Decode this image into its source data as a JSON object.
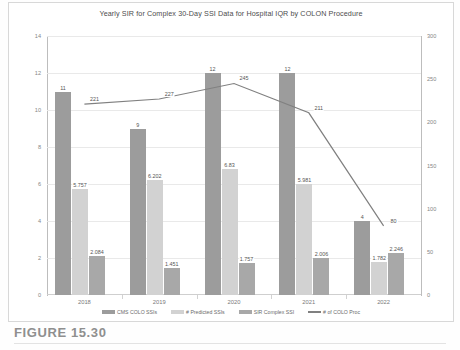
{
  "figure": {
    "caption": "FIGURE 15.30"
  },
  "chart_data": {
    "type": "bar",
    "title": "Yearly SIR for Complex 30-Day SSI Data for Hospital IQR by COLON Procedure",
    "xlabel": "",
    "ylabel": "",
    "categories": [
      "2018",
      "2019",
      "2020",
      "2021",
      "2022"
    ],
    "ylim": [
      0,
      14
    ],
    "yticks": [
      "0",
      "2",
      "4",
      "6",
      "8",
      "10",
      "12",
      "14"
    ],
    "y2lim": [
      0,
      300
    ],
    "y2ticks": [
      "0",
      "50",
      "100",
      "150",
      "200",
      "250",
      "300"
    ],
    "grid": true,
    "legend_position": "bottom",
    "series": [
      {
        "name": "CMS COLO SSIs",
        "type": "bar",
        "axis": "left",
        "color": "#9c9c9c",
        "values": [
          11,
          9,
          12,
          12,
          4
        ],
        "labels": [
          "11",
          "9",
          "12",
          "12",
          "4"
        ]
      },
      {
        "name": "# Predicted SSIs",
        "type": "bar",
        "axis": "left",
        "color": "#d2d2d2",
        "values": [
          5.757,
          6.202,
          6.83,
          5.981,
          1.782
        ],
        "labels": [
          "5.757",
          "6.202",
          "6.83",
          "5.981",
          "1.782"
        ]
      },
      {
        "name": "SIR Complex SSI",
        "type": "bar",
        "axis": "left",
        "color": "#a8a8a8",
        "values": [
          2.084,
          1.451,
          1.757,
          2.006,
          2.246
        ],
        "labels": [
          "2.084",
          "1.451",
          "1.757",
          "2.006",
          "2.246"
        ]
      },
      {
        "name": "# of COLO Proc",
        "type": "line",
        "axis": "right",
        "color": "#808080",
        "values": [
          221,
          227,
          245,
          211,
          80
        ],
        "labels": [
          "221",
          "227",
          "245",
          "211",
          "80"
        ]
      }
    ]
  }
}
